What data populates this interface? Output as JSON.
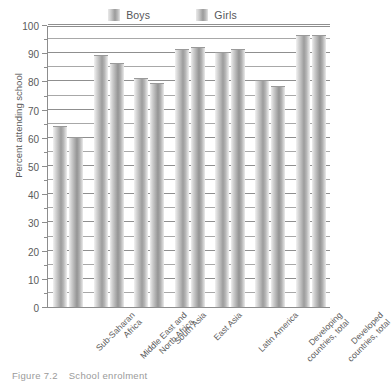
{
  "chart_data": {
    "type": "bar",
    "title": "",
    "xlabel": "",
    "ylabel": "Percent attending school",
    "ylim": [
      0,
      100
    ],
    "ytick_step": 10,
    "yminor_step": 5,
    "grid": true,
    "legend_position": "top-center",
    "categories": [
      "Sub-Saharan Africa",
      "Middle East and North Africa",
      "South Asia",
      "East Asia",
      "Latin America",
      "Developing countries, total",
      "Developed countries, total"
    ],
    "category_lines": [
      [
        "Sub-Saharan",
        "Africa"
      ],
      [
        "Middle East and",
        "North Africa"
      ],
      [
        "South Asia"
      ],
      [
        "East Asia"
      ],
      [
        "Latin America"
      ],
      [
        "Developing",
        "countries, total"
      ],
      [
        "Developed",
        "countries, total"
      ]
    ],
    "series": [
      {
        "name": "Boys",
        "color": "#b5b5b5",
        "values": [
          64,
          89,
          81,
          91,
          90,
          80,
          96
        ]
      },
      {
        "name": "Girls",
        "color": "#a0a0a0",
        "values": [
          60,
          86,
          79,
          92,
          91,
          78,
          96
        ]
      }
    ],
    "ytick_labels": [
      "100",
      "90",
      "80",
      "70",
      "60",
      "50",
      "40",
      "30",
      "20",
      "10",
      "0"
    ]
  },
  "legend": {
    "entries": [
      {
        "label": "Boys"
      },
      {
        "label": "Girls"
      }
    ]
  },
  "caption": {
    "number": "Figure 7.2",
    "text": "School enrolment"
  }
}
